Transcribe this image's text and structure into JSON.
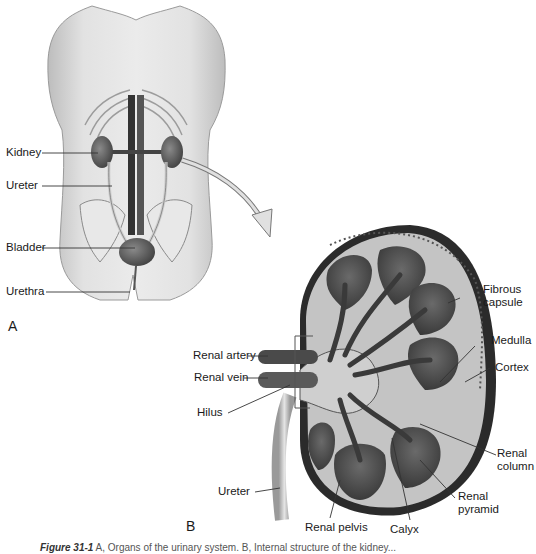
{
  "figure": {
    "panel_a": {
      "letter": "A",
      "labels": {
        "kidney": "Kidney",
        "ureter": "Ureter",
        "bladder": "Bladder",
        "urethra": "Urethra"
      }
    },
    "panel_b": {
      "letter": "B",
      "labels": {
        "fibrous_capsule_1": "Fibrous",
        "fibrous_capsule_2": "capsule",
        "medulla": "Medulla",
        "cortex": "Cortex",
        "renal_artery": "Renal artery",
        "renal_vein": "Renal vein",
        "hilus": "Hilus",
        "renal_column_1": "Renal",
        "renal_column_2": "column",
        "renal_pyramid_1": "Renal",
        "renal_pyramid_2": "pyramid",
        "ureter": "Ureter",
        "renal_pelvis": "Renal pelvis",
        "calyx": "Calyx"
      }
    },
    "caption": {
      "figure_number": "Figure 31-1",
      "text": "A, Organs of the urinary system. B, Internal structure of the kidney..."
    },
    "colors": {
      "skin": "#d9d9d9",
      "skin_dark": "#a8a8a8",
      "organ_dark": "#4a4a4a",
      "vessel": "#3a3a3a",
      "cortex": "#c4c4c4",
      "capsule": "#2b2b2b",
      "leader": "#333333"
    }
  }
}
